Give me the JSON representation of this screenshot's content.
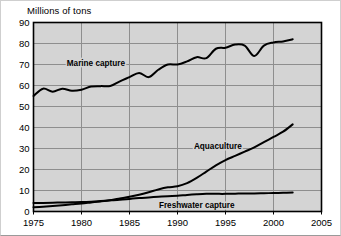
{
  "chart_data": {
    "type": "line",
    "title": "Millions of tons",
    "ylabel": "Millions of tons",
    "xlabel": "",
    "xlim": [
      1975,
      2005
    ],
    "ylim": [
      0,
      90
    ],
    "grid": true,
    "legend_position": "inline-labels",
    "xticks": [
      "1975",
      "1980",
      "1985",
      "1990",
      "1995",
      "2000",
      "2005"
    ],
    "xtick_values": [
      1975,
      1980,
      1985,
      1990,
      1995,
      2000,
      2005
    ],
    "yticks": [
      "0",
      "10",
      "20",
      "30",
      "40",
      "50",
      "60",
      "70",
      "80",
      "90"
    ],
    "ytick_values": [
      0,
      10,
      20,
      30,
      40,
      50,
      60,
      70,
      80,
      90
    ],
    "x": [
      1975,
      1976,
      1977,
      1978,
      1979,
      1980,
      1981,
      1982,
      1983,
      1984,
      1985,
      1986,
      1987,
      1988,
      1989,
      1990,
      1991,
      1992,
      1993,
      1994,
      1995,
      1996,
      1997,
      1998,
      1999,
      2000,
      2001,
      2002
    ],
    "series": [
      {
        "name": "Marine capture",
        "label": "Marine capture",
        "label_x": 1981.5,
        "label_y": 70.5,
        "color": "#000000",
        "values": [
          55.0,
          58.5,
          57.0,
          58.5,
          57.5,
          58.0,
          59.5,
          59.7,
          59.8,
          62.0,
          64.0,
          66.0,
          64.0,
          67.5,
          70.0,
          70.0,
          71.5,
          73.5,
          73.0,
          77.5,
          78.0,
          79.5,
          79.0,
          74.0,
          79.0,
          80.5,
          81.0,
          82.0
        ]
      },
      {
        "name": "Aquaculture",
        "label": "Aquaculture",
        "label_x": 1994.2,
        "label_y": 31.0,
        "color": "#000000",
        "values": [
          2.0,
          2.3,
          2.6,
          3.0,
          3.4,
          3.8,
          4.3,
          4.8,
          5.4,
          6.2,
          7.0,
          8.0,
          9.2,
          10.5,
          11.5,
          12.0,
          13.5,
          16.0,
          19.0,
          22.0,
          24.5,
          26.5,
          28.5,
          30.5,
          33.0,
          35.5,
          38.0,
          41.5
        ]
      },
      {
        "name": "Freshwater capture",
        "label": "Freshwater capture",
        "label_x": 1992.0,
        "label_y": 3.2,
        "color": "#000000",
        "values": [
          4.0,
          4.1,
          4.2,
          4.3,
          4.4,
          4.5,
          4.7,
          5.0,
          5.3,
          5.6,
          6.0,
          6.4,
          6.7,
          7.0,
          7.3,
          7.5,
          7.9,
          8.2,
          8.4,
          8.4,
          8.4,
          8.5,
          8.6,
          8.6,
          8.7,
          8.8,
          8.9,
          9.0
        ]
      }
    ]
  },
  "style": {
    "plot_background": "#d4d4d4",
    "gridline_color": "#8e8e8e",
    "axis_color": "#000000",
    "line_color": "#000000"
  }
}
